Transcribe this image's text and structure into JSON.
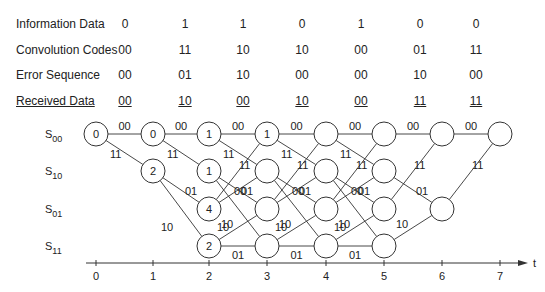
{
  "table": {
    "rows": [
      {
        "label": "Information Data",
        "values": [
          "0",
          "1",
          "1",
          "0",
          "1",
          "0",
          "0"
        ],
        "underline": false
      },
      {
        "label": "Convolution Codes",
        "values": [
          "00",
          "11",
          "10",
          "10",
          "00",
          "01",
          "11"
        ],
        "underline": false
      },
      {
        "label": "Error Sequence",
        "values": [
          "00",
          "01",
          "10",
          "00",
          "00",
          "10",
          "00"
        ],
        "underline": false
      },
      {
        "label": "Received Data",
        "values": [
          "00",
          "10",
          "00",
          "10",
          "00",
          "11",
          "11"
        ],
        "underline": true
      }
    ]
  },
  "trellis": {
    "states": [
      "S00",
      "S10",
      "S01",
      "S11"
    ],
    "state_labels": [
      {
        "base": "S",
        "sub": "00"
      },
      {
        "base": "S",
        "sub": "10"
      },
      {
        "base": "S",
        "sub": "01"
      },
      {
        "base": "S",
        "sub": "11"
      }
    ],
    "time_axis": {
      "ticks": [
        "0",
        "1",
        "2",
        "3",
        "4",
        "5",
        "6",
        "7"
      ],
      "label": "t"
    },
    "nodes": [
      {
        "t": 0,
        "state": "S00",
        "metric": "0"
      },
      {
        "t": 1,
        "state": "S00",
        "metric": "0"
      },
      {
        "t": 1,
        "state": "S10",
        "metric": "2"
      },
      {
        "t": 2,
        "state": "S00",
        "metric": "1"
      },
      {
        "t": 2,
        "state": "S10",
        "metric": "1"
      },
      {
        "t": 2,
        "state": "S01",
        "metric": "4"
      },
      {
        "t": 2,
        "state": "S11",
        "metric": "2"
      },
      {
        "t": 3,
        "state": "S00",
        "metric": "1"
      },
      {
        "t": 3,
        "state": "S10",
        "metric": ""
      },
      {
        "t": 3,
        "state": "S01",
        "metric": ""
      },
      {
        "t": 3,
        "state": "S11",
        "metric": ""
      },
      {
        "t": 4,
        "state": "S00",
        "metric": ""
      },
      {
        "t": 4,
        "state": "S10",
        "metric": ""
      },
      {
        "t": 4,
        "state": "S01",
        "metric": ""
      },
      {
        "t": 4,
        "state": "S11",
        "metric": ""
      },
      {
        "t": 5,
        "state": "S00",
        "metric": ""
      },
      {
        "t": 5,
        "state": "S10",
        "metric": ""
      },
      {
        "t": 5,
        "state": "S01",
        "metric": ""
      },
      {
        "t": 5,
        "state": "S11",
        "metric": ""
      },
      {
        "t": 6,
        "state": "S00",
        "metric": ""
      },
      {
        "t": 6,
        "state": "S01",
        "metric": ""
      },
      {
        "t": 7,
        "state": "S00",
        "metric": ""
      }
    ],
    "branch_labels": {
      "S00_S00": "00",
      "S00_S10": "11",
      "S10_S01": "01",
      "S10_S11": "10",
      "S01_S00": "11",
      "S01_S10": "00",
      "S11_S01": "10",
      "S11_S11": "01"
    }
  }
}
